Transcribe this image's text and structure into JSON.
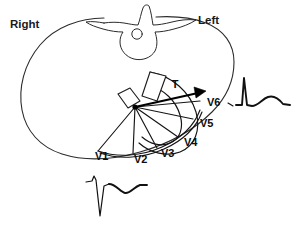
{
  "figure": {
    "background_color": "#ffffff",
    "ink_color": "#1a1a1a"
  },
  "orientation_labels": {
    "right": "Right",
    "left": "Left"
  },
  "vector": {
    "label": "T",
    "description": "mean T wave vector arrow directed leftward toward V6"
  },
  "leads": [
    {
      "name": "V1",
      "label_x": 95,
      "label_y": 160
    },
    {
      "name": "V2",
      "label_x": 134,
      "label_y": 163
    },
    {
      "name": "V3",
      "label_x": 161,
      "label_y": 157
    },
    {
      "name": "V4",
      "label_x": 184,
      "label_y": 146
    },
    {
      "name": "V5",
      "label_x": 200,
      "label_y": 127
    },
    {
      "name": "V6",
      "label_x": 207,
      "label_y": 106
    }
  ],
  "anatomy": {
    "thorax": "thoracic cross-section outline",
    "vertebra": "vertebral body with spinous and transverse processes",
    "spinal_canal": "spinal canal circle",
    "heart": "ventricular mass arc with myocardial segments"
  },
  "ecg_traces": [
    {
      "id": "v6-trace",
      "lead": "V6",
      "position": "right",
      "morphology": "tall R wave with upright T wave"
    },
    {
      "id": "v1-trace",
      "lead": "V1",
      "position": "bottom",
      "morphology": "small r wave, deep S wave, inverted T wave"
    }
  ],
  "colors": {
    "ink": "#1a1a1a",
    "vector": "#000000",
    "paper": "#ffffff"
  }
}
